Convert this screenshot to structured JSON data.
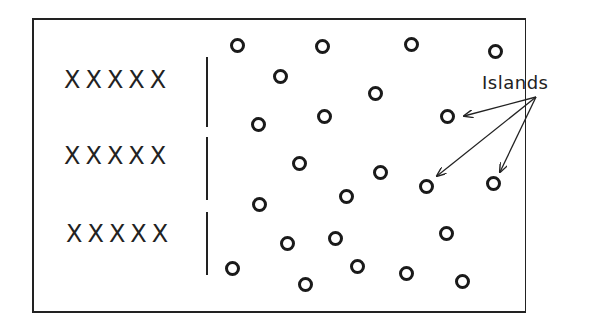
{
  "diagram": {
    "label": "Islands",
    "x_rows": [
      {
        "text": "XXXXX",
        "x": 64,
        "y": 66
      },
      {
        "text": "XXXXX",
        "x": 64,
        "y": 142
      },
      {
        "text": "XXXXX",
        "x": 66,
        "y": 220
      }
    ],
    "dividers": [
      {
        "top": 57,
        "height": 70
      },
      {
        "top": 137,
        "height": 63
      },
      {
        "top": 212,
        "height": 63
      }
    ],
    "islands": [
      {
        "x": 237,
        "y": 45
      },
      {
        "x": 322,
        "y": 46
      },
      {
        "x": 411,
        "y": 44
      },
      {
        "x": 495,
        "y": 51
      },
      {
        "x": 280,
        "y": 76
      },
      {
        "x": 375,
        "y": 93
      },
      {
        "x": 258,
        "y": 124
      },
      {
        "x": 324,
        "y": 116
      },
      {
        "x": 447,
        "y": 116
      },
      {
        "x": 299,
        "y": 163
      },
      {
        "x": 380,
        "y": 172
      },
      {
        "x": 426,
        "y": 186
      },
      {
        "x": 493,
        "y": 183
      },
      {
        "x": 259,
        "y": 204
      },
      {
        "x": 346,
        "y": 196
      },
      {
        "x": 287,
        "y": 243
      },
      {
        "x": 335,
        "y": 238
      },
      {
        "x": 446,
        "y": 233
      },
      {
        "x": 232,
        "y": 268
      },
      {
        "x": 357,
        "y": 266
      },
      {
        "x": 406,
        "y": 273
      },
      {
        "x": 462,
        "y": 281
      },
      {
        "x": 305,
        "y": 284
      }
    ],
    "arrows": [
      {
        "from": [
          536,
          97
        ],
        "to": [
          464,
          116
        ]
      },
      {
        "from": [
          536,
          97
        ],
        "to": [
          437,
          176
        ]
      },
      {
        "from": [
          536,
          97
        ],
        "to": [
          500,
          172
        ]
      }
    ]
  }
}
